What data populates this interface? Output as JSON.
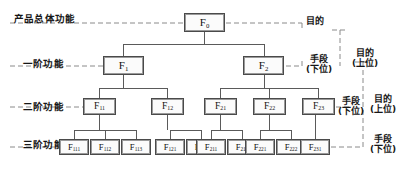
{
  "diagram": {
    "type": "tree",
    "line_color": "#555555",
    "box_border_color": "#4a4a4a",
    "box_fill_color": "#fbfbfb",
    "dash_color": "#808080"
  },
  "tier_labels": [
    {
      "text": "产品总体功能",
      "x": 14,
      "y": 11
    },
    {
      "text": "一阶功能",
      "x": 23,
      "y": 56
    },
    {
      "text": "二阶功能",
      "x": 23,
      "y": 99
    },
    {
      "text": "三阶功能",
      "x": 23,
      "y": 137
    }
  ],
  "nodes": {
    "root": [
      {
        "base": "F",
        "sub": "0",
        "x": 184,
        "y": 13,
        "tier": "t0"
      }
    ],
    "tier1": [
      {
        "base": "F",
        "sub": "1",
        "x": 103,
        "y": 56,
        "tier": "t1"
      },
      {
        "base": "F",
        "sub": "2",
        "x": 243,
        "y": 56,
        "tier": "t1"
      }
    ],
    "tier2": [
      {
        "base": "F",
        "sub": "11",
        "x": 83,
        "y": 98,
        "tier": "t2"
      },
      {
        "base": "F",
        "sub": "12",
        "x": 151,
        "y": 98,
        "tier": "t2"
      },
      {
        "base": "F",
        "sub": "21",
        "x": 204,
        "y": 98,
        "tier": "t2"
      },
      {
        "base": "F",
        "sub": "22",
        "x": 253,
        "y": 98,
        "tier": "t2"
      },
      {
        "base": "F",
        "sub": "23",
        "x": 302,
        "y": 98,
        "tier": "t2"
      }
    ],
    "tier3": [
      {
        "base": "F",
        "sub": "111",
        "x": 59,
        "y": 139,
        "tier": "t3"
      },
      {
        "base": "F",
        "sub": "112",
        "x": 90,
        "y": 139,
        "tier": "t3"
      },
      {
        "base": "F",
        "sub": "113",
        "x": 121,
        "y": 139,
        "tier": "t3"
      },
      {
        "base": "F",
        "sub": "121",
        "x": 155,
        "y": 139,
        "tier": "t3"
      },
      {
        "base": "F",
        "sub": "122",
        "x": 186,
        "y": 139,
        "tier": "t3"
      },
      {
        "base": "F",
        "sub": "211",
        "x": 196,
        "y": 139,
        "tier": "t3"
      },
      {
        "base": "F",
        "sub": "212",
        "x": 227,
        "y": 139,
        "tier": "t3"
      },
      {
        "base": "F",
        "sub": "221",
        "x": 245,
        "y": 139,
        "tier": "t3"
      },
      {
        "base": "F",
        "sub": "222",
        "x": 276,
        "y": 139,
        "tier": "t3"
      },
      {
        "base": "F",
        "sub": "231",
        "x": 300,
        "y": 139,
        "tier": "t3"
      }
    ]
  },
  "annotations": [
    {
      "id": "a1",
      "line1": "目的",
      "line2": "",
      "x": 306,
      "y": 18
    },
    {
      "id": "a2",
      "line1": "手段",
      "line2": "(下位)",
      "x": 306,
      "y": 56
    },
    {
      "id": "a3",
      "line1": "目的",
      "line2": "(上位)",
      "x": 355,
      "y": 50
    },
    {
      "id": "a4",
      "line1": "目的",
      "line2": "(上位)",
      "x": 368,
      "y": 96
    },
    {
      "id": "a5",
      "line1": "手段",
      "line2": "(下位)",
      "x": 368,
      "y": 136
    }
  ],
  "edges_note": "solid orthogonal connectors parent->children; dashed horizontal tier guide lines on left; dashed relation brackets on right"
}
